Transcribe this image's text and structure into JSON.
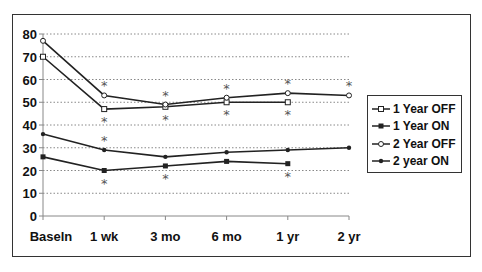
{
  "chart_data": {
    "type": "line",
    "title": "",
    "xlabel": "",
    "ylabel": "",
    "ylim": [
      0,
      80
    ],
    "yticks": [
      0,
      10,
      20,
      30,
      40,
      50,
      60,
      70,
      80
    ],
    "grid": "horizontal dotted",
    "legend_position": "right",
    "categories": [
      "Baseln",
      "1 wk",
      "3 mo",
      "6 mo",
      "1 yr",
      "2 yr"
    ],
    "series": [
      {
        "name": "1 Year OFF",
        "marker": "open-square",
        "values": [
          70,
          47,
          48,
          50,
          50,
          null
        ]
      },
      {
        "name": "1 Year ON",
        "marker": "filled-square",
        "values": [
          26,
          20,
          22,
          24,
          23,
          null
        ]
      },
      {
        "name": "2 Year OFF",
        "marker": "open-circle",
        "values": [
          77,
          53,
          49,
          52,
          54,
          53
        ]
      },
      {
        "name": "2 year ON",
        "marker": "filled-circle",
        "values": [
          36,
          29,
          26,
          28,
          29,
          30
        ]
      }
    ],
    "annotations": [
      {
        "text": "*",
        "category": "1 wk",
        "near_series": "2 Year OFF",
        "position": "above"
      },
      {
        "text": "*",
        "category": "1 wk",
        "near_series": "1 Year OFF",
        "position": "below"
      },
      {
        "text": "*",
        "category": "3 mo",
        "near_series": "2 Year OFF",
        "position": "above"
      },
      {
        "text": "*",
        "category": "3 mo",
        "near_series": "1 Year OFF",
        "position": "below"
      },
      {
        "text": "*",
        "category": "6 mo",
        "near_series": "2 Year OFF",
        "position": "above"
      },
      {
        "text": "*",
        "category": "6 mo",
        "near_series": "1 Year OFF",
        "position": "below"
      },
      {
        "text": "*",
        "category": "1 yr",
        "near_series": "2 Year OFF",
        "position": "above"
      },
      {
        "text": "*",
        "category": "1 yr",
        "near_series": "1 Year OFF",
        "position": "below"
      },
      {
        "text": "*",
        "category": "2 yr",
        "near_series": "2 Year OFF",
        "position": "above"
      },
      {
        "text": "*",
        "category": "1 wk",
        "near_series": "2 year ON",
        "position": "above"
      },
      {
        "text": "*",
        "category": "1 wk",
        "near_series": "1 Year ON",
        "position": "below"
      },
      {
        "text": "*",
        "category": "3 mo",
        "near_series": "1 Year ON",
        "position": "below"
      },
      {
        "text": "*",
        "category": "1 yr",
        "near_series": "1 Year ON",
        "position": "below"
      }
    ]
  },
  "legend": {
    "items": [
      {
        "label": "1 Year OFF"
      },
      {
        "label": "1 Year ON"
      },
      {
        "label": "2 Year OFF"
      },
      {
        "label": "2 year ON"
      }
    ]
  },
  "colors": {
    "line": "#222222",
    "grid": "#888888",
    "asterisk": "#555555"
  }
}
